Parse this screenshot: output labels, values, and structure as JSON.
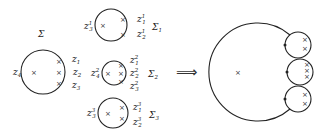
{
  "left": {
    "main_surface": {
      "label": "Σ",
      "marks": [
        {
          "name": "z",
          "sub": "1"
        },
        {
          "name": "z",
          "sub": "2"
        },
        {
          "name": "z",
          "sub": "3"
        },
        {
          "name": "z",
          "sub": "4"
        }
      ]
    },
    "components": [
      {
        "label": "Σ",
        "label_sub": "1",
        "marks": [
          {
            "name": "z",
            "sup": "1",
            "sub": "1"
          },
          {
            "name": "z",
            "sup": "1",
            "sub": "2"
          },
          {
            "name": "z",
            "sup": "1",
            "sub": "3"
          }
        ]
      },
      {
        "label": "Σ",
        "label_sub": "2",
        "marks": [
          {
            "name": "z",
            "sup": "2",
            "sub": "1"
          },
          {
            "name": "z",
            "sup": "2",
            "sub": "2"
          },
          {
            "name": "z",
            "sup": "2",
            "sub": "3"
          },
          {
            "name": "z",
            "sup": "2",
            "sub": "4"
          }
        ]
      },
      {
        "label": "Σ",
        "label_sub": "3",
        "marks": [
          {
            "name": "z",
            "sup": "3",
            "sub": "1"
          },
          {
            "name": "z",
            "sup": "3",
            "sub": "2"
          },
          {
            "name": "z",
            "sup": "3",
            "sub": "3"
          }
        ]
      }
    ]
  },
  "arrow": "⟹",
  "cross_glyph": "×",
  "colors": {
    "stroke": "#222222",
    "background": "#ffffff"
  }
}
